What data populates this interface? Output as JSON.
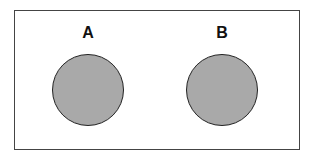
{
  "diagram": {
    "type": "set-diagram",
    "sets": [
      {
        "label": "A",
        "fill": "#a9a9a9"
      },
      {
        "label": "B",
        "fill": "#a9a9a9"
      }
    ],
    "relationship": "disjoint"
  }
}
